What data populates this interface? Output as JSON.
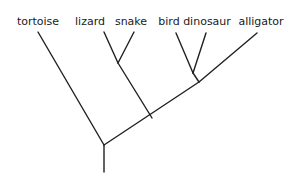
{
  "diagram": {
    "type": "cladogram",
    "title": "",
    "background_color": "#ffffff",
    "line_color": "#231f20",
    "line_width": 1.4,
    "text_color": "#1a1a1a",
    "taxa": [
      {
        "name": "tortoise",
        "label_x": 38,
        "label_y": 16,
        "tip_x": 38,
        "tip_y": 32
      },
      {
        "name": "lizard",
        "label_x": 90,
        "label_y": 16,
        "tip_x": 104,
        "tip_y": 32
      },
      {
        "name": "snake",
        "label_x": 131,
        "label_y": 16,
        "tip_x": 134,
        "tip_y": 32
      },
      {
        "name": "bird",
        "label_x": 169,
        "label_y": 16,
        "tip_x": 176,
        "tip_y": 33
      },
      {
        "name": "dinosaur",
        "label_x": 207,
        "label_y": 16,
        "tip_x": 206,
        "tip_y": 33
      },
      {
        "name": "alligator",
        "label_x": 261,
        "label_y": 16,
        "tip_x": 257,
        "tip_y": 33
      }
    ],
    "nodes": [
      {
        "name": "squamate-node",
        "x": 118,
        "y": 63
      },
      {
        "name": "bird-dino-node",
        "x": 193,
        "y": 73
      },
      {
        "name": "archosaur-node",
        "x": 199,
        "y": 82
      },
      {
        "name": "diapsid-node",
        "x": 152,
        "y": 118
      },
      {
        "name": "root-node",
        "x": 104,
        "y": 145
      },
      {
        "name": "root-stem-bottom",
        "x": 104,
        "y": 172
      }
    ],
    "branches": [
      {
        "name": "branch-tortoise",
        "x1": 38,
        "y1": 32,
        "x2": 104,
        "y2": 145
      },
      {
        "name": "branch-lizard",
        "x1": 104,
        "y1": 32,
        "x2": 118,
        "y2": 63
      },
      {
        "name": "branch-snake",
        "x1": 134,
        "y1": 32,
        "x2": 118,
        "y2": 63
      },
      {
        "name": "branch-squamates",
        "x1": 118,
        "y1": 63,
        "x2": 152,
        "y2": 118
      },
      {
        "name": "branch-bird",
        "x1": 176,
        "y1": 33,
        "x2": 193,
        "y2": 73
      },
      {
        "name": "branch-dinosaur",
        "x1": 206,
        "y1": 33,
        "x2": 193,
        "y2": 73
      },
      {
        "name": "branch-bird-dino",
        "x1": 193,
        "y1": 73,
        "x2": 199,
        "y2": 82
      },
      {
        "name": "branch-alligator",
        "x1": 257,
        "y1": 33,
        "x2": 199,
        "y2": 82
      },
      {
        "name": "branch-archosaurs",
        "x1": 199,
        "y1": 82,
        "x2": 104,
        "y2": 145
      },
      {
        "name": "branch-root-stem",
        "x1": 104,
        "y1": 145,
        "x2": 104,
        "y2": 172
      }
    ]
  }
}
